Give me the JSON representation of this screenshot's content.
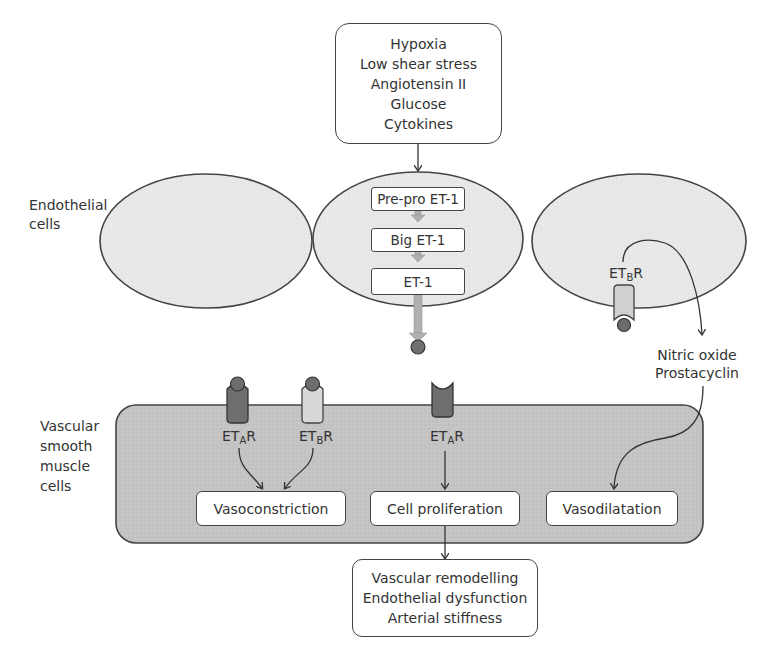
{
  "diagram": {
    "stimuli_box": {
      "lines": [
        "Hypoxia",
        "Low shear stress",
        "Angiotensin II",
        "Glucose",
        "Cytokines"
      ]
    },
    "labels": {
      "endothelial_cells": [
        "Endothelial",
        "cells"
      ],
      "vascular_smooth_muscle_cells": [
        "Vascular",
        "smooth",
        "muscle",
        "cells"
      ]
    },
    "synthesis_steps": [
      "Pre-pro ET-1",
      "Big ET-1",
      "ET-1"
    ],
    "receptors": {
      "endothelial_etb": {
        "prefix": "ET",
        "sub": "B",
        "suffix": "R"
      },
      "vsmc_eta_left": {
        "prefix": "ET",
        "sub": "A",
        "suffix": "R"
      },
      "vsmc_etb": {
        "prefix": "ET",
        "sub": "B",
        "suffix": "R"
      },
      "vsmc_eta_middle": {
        "prefix": "ET",
        "sub": "A",
        "suffix": "R"
      }
    },
    "mediators": [
      "Nitric oxide",
      "Prostacyclin"
    ],
    "effects": {
      "vasoconstriction": "Vasoconstriction",
      "cell_proliferation": "Cell proliferation",
      "vasodilatation": "Vasodilatation"
    },
    "outcomes_box": {
      "lines": [
        "Vascular remodelling",
        "Endothelial dysfunction",
        "Arterial stiffness"
      ]
    },
    "colors": {
      "cell_fill": "#e6e6e6",
      "vsmc_fill": "#c4c4c4",
      "outline": "#444444",
      "eta_receptor": "#6e6e6e",
      "etb_receptor": "#d6d6d6",
      "ligand": "#707070",
      "arrow_gray": "#b0b0b0"
    }
  }
}
